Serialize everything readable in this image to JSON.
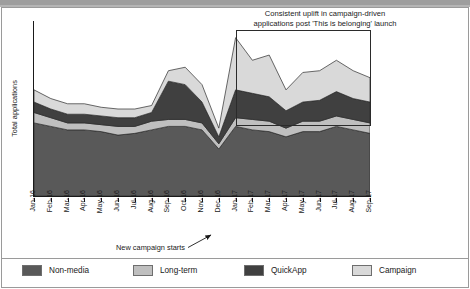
{
  "figure": {
    "annotation_title": "Consistent uplift in campaign-driven\napplications post 'This is belonging' launch",
    "campaign_note": "New campaign starts"
  },
  "legend": {
    "items": [
      {
        "label": "Non-media",
        "color": "#595959"
      },
      {
        "label": "Long-term",
        "color": "#bfbfbf"
      },
      {
        "label": "QuickApp",
        "color": "#404040"
      },
      {
        "label": "Campaign",
        "color": "#d9d9d9"
      }
    ]
  },
  "chart_data": {
    "type": "area",
    "stacked": true,
    "title": "",
    "xlabel": "",
    "ylabel": "Total applications",
    "grid": false,
    "legend_position": "bottom",
    "ylim": [
      0,
      100
    ],
    "yticks_visible": false,
    "categories": [
      "Jan-16",
      "Feb-16",
      "Mar-16",
      "Apr-16",
      "May-16",
      "Jun-16",
      "Jul-16",
      "Aug-16",
      "Sep-16",
      "Oct-16",
      "Nov-16",
      "Dec-16",
      "Jan-17",
      "Feb-17",
      "Mar-17",
      "Apr-17",
      "May-17",
      "Jun-17",
      "Jul-17",
      "Aug-17",
      "Sep-17"
    ],
    "series": [
      {
        "name": "Non-media",
        "color": "#595959",
        "values": [
          42,
          40,
          38,
          38,
          37,
          35,
          36,
          38,
          40,
          40,
          38,
          27,
          40,
          38,
          37,
          34,
          37,
          37,
          40,
          38,
          36
        ]
      },
      {
        "name": "Long-term",
        "color": "#bfbfbf",
        "values": [
          6,
          5,
          4,
          4,
          4,
          5,
          4,
          5,
          4,
          4,
          4,
          3,
          5,
          6,
          6,
          5,
          6,
          6,
          6,
          6,
          6
        ]
      },
      {
        "name": "QuickApp",
        "color": "#404040",
        "values": [
          6,
          5,
          5,
          5,
          5,
          5,
          5,
          5,
          22,
          20,
          12,
          4,
          16,
          15,
          14,
          10,
          11,
          12,
          14,
          12,
          12
        ]
      },
      {
        "name": "Campaign",
        "color": "#d9d9d9",
        "values": [
          7,
          6,
          6,
          6,
          5,
          5,
          5,
          4,
          6,
          10,
          10,
          5,
          30,
          19,
          24,
          12,
          17,
          17,
          18,
          16,
          14
        ]
      }
    ],
    "annotations": [
      {
        "name": "uplift-callout",
        "text": "Consistent uplift in campaign-driven applications post 'This is belonging' launch",
        "box_from": "Jan-17",
        "box_to": "Sep-17"
      },
      {
        "name": "campaign-start-arrow",
        "text": "New campaign starts",
        "points_to": "Jan-17"
      }
    ]
  }
}
